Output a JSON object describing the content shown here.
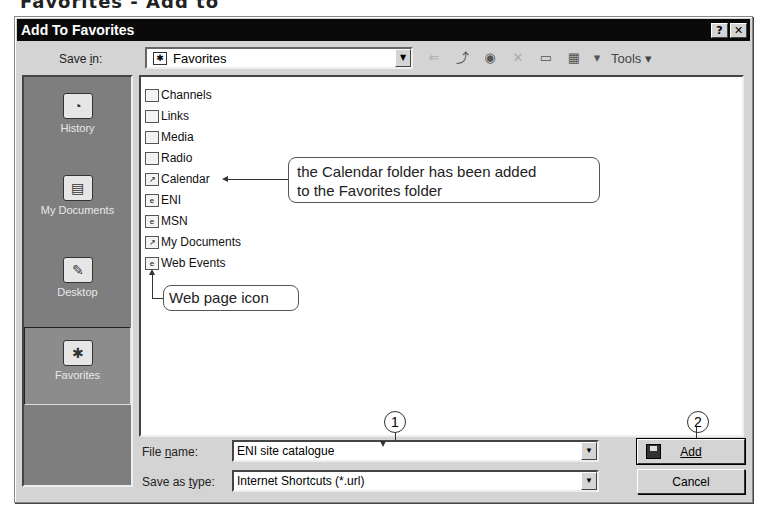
{
  "page_heading_cropped": "Favorites - Add to",
  "dialog": {
    "title": "Add To Favorites",
    "help_button": "?",
    "close_button": "✕"
  },
  "save_in": {
    "label": "Save in:",
    "value": "Favorites",
    "icon": "favorites-folder-icon"
  },
  "toolbar": {
    "items": [
      {
        "name": "back-icon",
        "glyph": "⇐",
        "enabled": false
      },
      {
        "name": "up-one-level-icon",
        "glyph": "⤴",
        "enabled": true
      },
      {
        "name": "search-web-icon",
        "glyph": "◉",
        "enabled": true
      },
      {
        "name": "delete-icon",
        "glyph": "✕",
        "enabled": false
      },
      {
        "name": "create-new-folder-icon",
        "glyph": "▭",
        "enabled": true
      },
      {
        "name": "views-icon",
        "glyph": "▦",
        "enabled": true
      }
    ],
    "views_dropdown": "▾",
    "tools_label": "Tools",
    "tools_dropdown": "▾"
  },
  "places_bar": [
    {
      "label": "History",
      "icon": "history-icon",
      "glyph": "◔",
      "selected": false
    },
    {
      "label": "My Documents",
      "icon": "my-documents-icon",
      "glyph": "▤",
      "selected": false
    },
    {
      "label": "Desktop",
      "icon": "desktop-icon",
      "glyph": "✎",
      "selected": false
    },
    {
      "label": "Favorites",
      "icon": "favorites-icon",
      "glyph": "✱",
      "selected": true
    }
  ],
  "files": [
    {
      "name": "Channels",
      "type": "folder"
    },
    {
      "name": "Links",
      "type": "folder"
    },
    {
      "name": "Media",
      "type": "folder"
    },
    {
      "name": "Radio",
      "type": "folder"
    },
    {
      "name": "Calendar",
      "type": "shortcut"
    },
    {
      "name": "ENI",
      "type": "web-page"
    },
    {
      "name": "MSN",
      "type": "web-page"
    },
    {
      "name": "My Documents",
      "type": "shortcut-folder"
    },
    {
      "name": "Web Events",
      "type": "web-page"
    }
  ],
  "annotations": {
    "calendar_callout": "the Calendar folder has been added to the Favorites folder",
    "calendar_callout_line1": "the Calendar folder has been added",
    "calendar_callout_line2": "to the Favorites folder",
    "web_icon_callout": "Web page icon",
    "step1": "1",
    "step2": "2"
  },
  "file_name": {
    "label": "File name:",
    "value": "ENI site catalogue"
  },
  "save_as_type": {
    "label": "Save as type:",
    "value": "Internet Shortcuts (*.url)"
  },
  "buttons": {
    "add": "Add",
    "cancel": "Cancel"
  }
}
